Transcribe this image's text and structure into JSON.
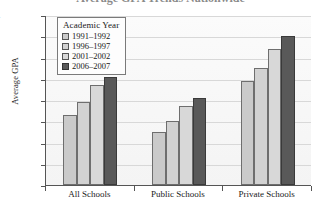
{
  "figure": {
    "title_fragment": "Average GPA Trends Nationwide",
    "title_clipped": true
  },
  "legend": {
    "title": "Academic Year",
    "position": "inside-top-left",
    "entries": [
      {
        "label": "1991–1992",
        "color": "#cacaca"
      },
      {
        "label": "1996–1997",
        "color": "#d2d2d2"
      },
      {
        "label": "2001–2002",
        "color": "#d8d8d8"
      },
      {
        "label": "2006–2007",
        "color": "#595959"
      }
    ]
  },
  "axes": {
    "ylabel": "Average GPA",
    "yticks": [
      "3.4",
      "3.3",
      "3.2",
      "3.1",
      "3.0",
      "2.9",
      "2.8",
      "2.7",
      "2.6"
    ],
    "ytick_values": [
      3.4,
      3.3,
      3.2,
      3.1,
      3.0,
      2.9,
      2.8,
      2.7,
      2.6
    ],
    "ylim": [
      2.6,
      3.4
    ],
    "xlabel": "",
    "xticklabels": [
      "All Schools",
      "Public Schools",
      "Private Schools"
    ]
  },
  "chart_data": {
    "type": "bar",
    "title": "Average GPA Trends Nationwide",
    "xlabel": "",
    "ylabel": "Average GPA",
    "ylim": [
      2.6,
      3.4
    ],
    "grid": "horizontal",
    "legend_title": "Academic Year",
    "legend_position": "inside-top-left",
    "categories": [
      "All Schools",
      "Public Schools",
      "Private Schools"
    ],
    "series": [
      {
        "name": "1991–1992",
        "color": "#cacaca",
        "values": [
          2.93,
          2.85,
          3.09
        ]
      },
      {
        "name": "1996–1997",
        "color": "#d2d2d2",
        "values": [
          2.99,
          2.9,
          3.15
        ]
      },
      {
        "name": "2001–2002",
        "color": "#d8d8d8",
        "values": [
          3.07,
          2.97,
          3.24
        ]
      },
      {
        "name": "2006–2007",
        "color": "#595959",
        "values": [
          3.11,
          3.01,
          3.3
        ]
      }
    ]
  }
}
